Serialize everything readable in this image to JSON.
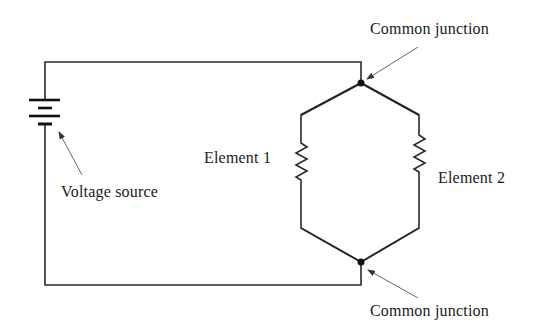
{
  "diagram": {
    "labels": {
      "voltage_source": "Voltage source",
      "element_1": "Element 1",
      "element_2": "Element 2",
      "junction_top": "Common junction",
      "junction_bottom": "Common junction"
    },
    "components": [
      {
        "type": "battery",
        "name": "Voltage source"
      },
      {
        "type": "resistor",
        "name": "Element 1"
      },
      {
        "type": "resistor",
        "name": "Element 2"
      },
      {
        "type": "junction",
        "name": "Common junction",
        "position": "top"
      },
      {
        "type": "junction",
        "name": "Common junction",
        "position": "bottom"
      }
    ],
    "colors": {
      "line": "#2a2a2a",
      "background": "#ffffff"
    }
  }
}
